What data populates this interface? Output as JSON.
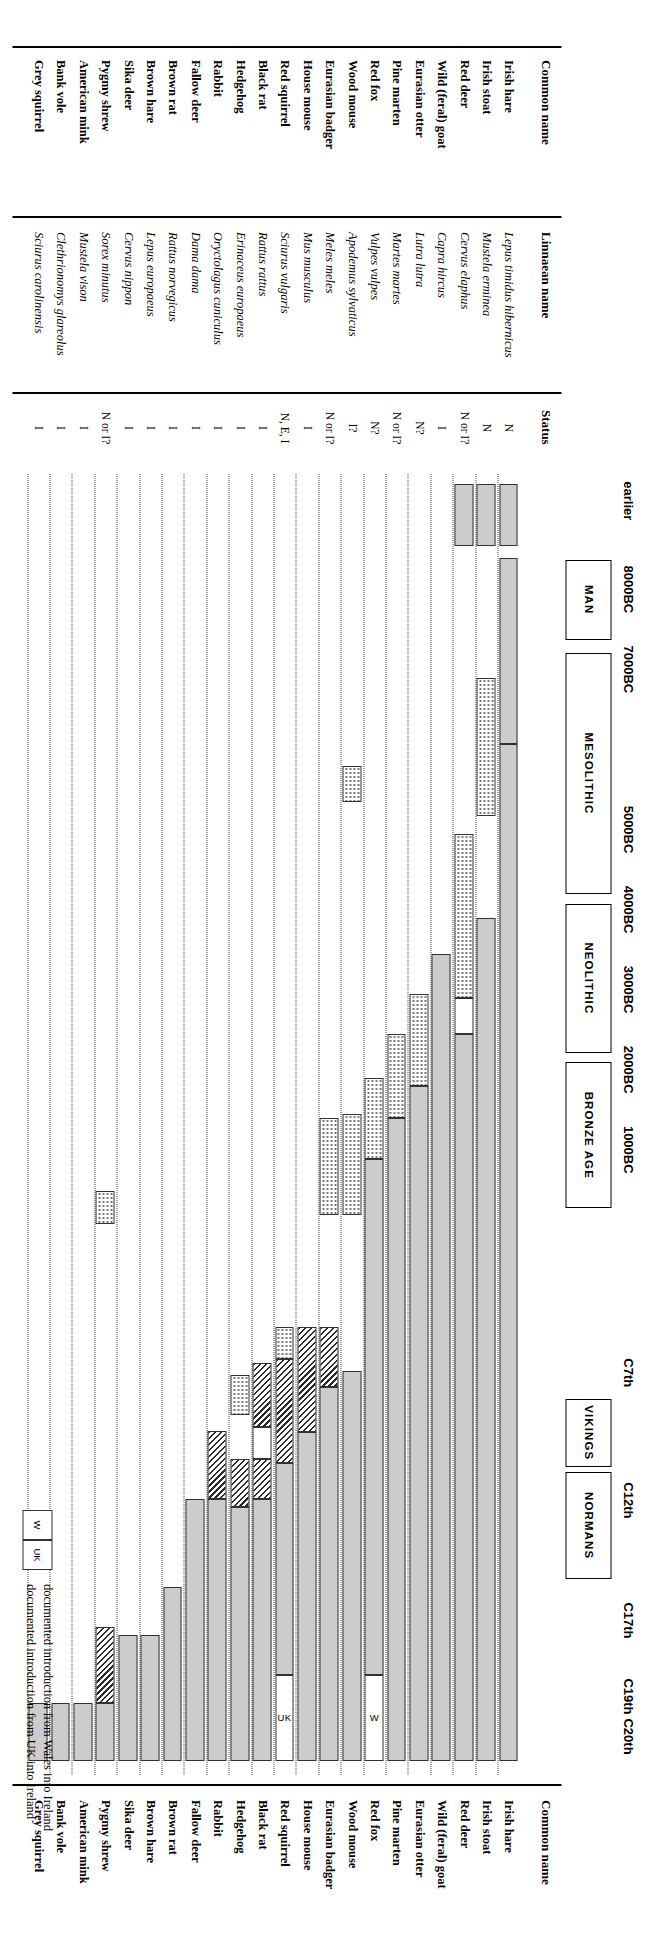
{
  "figure": {
    "headers": {
      "common_name_left": "Common name",
      "linnaean_name": "Linnaean name",
      "status": "Status",
      "common_name_right": "Common name"
    },
    "axis_ticks": [
      {
        "label": "earlier",
        "x": 0.5
      },
      {
        "label": "8000BC",
        "x": 1.5
      },
      {
        "label": "7000BC",
        "x": 2.5
      },
      {
        "label": "5000BC",
        "x": 4.5
      },
      {
        "label": "4000BC",
        "x": 5.5
      },
      {
        "label": "3000BC",
        "x": 6.5
      },
      {
        "label": "2000BC",
        "x": 7.5
      },
      {
        "label": "1000BC",
        "x": 8.5
      },
      {
        "label": "C7th",
        "x": 11.3
      },
      {
        "label": "C12th",
        "x": 12.9
      },
      {
        "label": "C17th",
        "x": 14.4
      },
      {
        "label": "C19th",
        "x": 15.35
      },
      {
        "label": "C20th",
        "x": 15.85
      }
    ],
    "eras": [
      {
        "label": "MAN",
        "start": 1.12,
        "end": 2.12
      },
      {
        "label": "MESOLITHIC",
        "start": 2.28,
        "end": 5.3
      },
      {
        "label": "NEOLITHIC",
        "start": 5.42,
        "end": 7.28
      },
      {
        "label": "BRONZE AGE",
        "start": 7.4,
        "end": 9.22
      },
      {
        "label": "VIKINGS",
        "start": 11.6,
        "end": 12.45
      },
      {
        "label": "NORMANS",
        "start": 12.52,
        "end": 13.85
      }
    ],
    "legend": {
      "swatches": [
        {
          "fill": "solid",
          "text": "remains found in secure contexts in Ireland"
        },
        {
          "fill": "dots",
          "text": "undated remains present in Ireland, probably intrusive"
        },
        {
          "fill": "hatch",
          "text": "documentary evidence"
        }
      ],
      "intro_swatches": [
        {
          "code": "W",
          "text": "documented introduction from Wales into Ireland"
        },
        {
          "code": "UK",
          "text": "documented introduction from UK into Ireland"
        }
      ]
    },
    "species": [
      {
        "common": "Irish hare",
        "latin": "Lepus timidus hibernicus",
        "status": "N",
        "segments": [
          {
            "from": 0.18,
            "to": 0.95,
            "fill": "solid"
          },
          {
            "from": 1.1,
            "to": 3.42,
            "fill": "solid"
          },
          {
            "from": 3.42,
            "to": 16.12,
            "fill": "solid"
          }
        ]
      },
      {
        "common": "Irish stoat",
        "latin": "Mustela erminea",
        "status": "N",
        "segments": [
          {
            "from": 0.18,
            "to": 0.95,
            "fill": "solid"
          },
          {
            "from": 2.6,
            "to": 4.32,
            "fill": "dots"
          },
          {
            "from": 5.6,
            "to": 16.12,
            "fill": "solid"
          }
        ]
      },
      {
        "common": "Red deer",
        "latin": "Cervus elaphus",
        "status": "N or I?",
        "segments": [
          {
            "from": 0.18,
            "to": 0.95,
            "fill": "solid"
          },
          {
            "from": 4.55,
            "to": 6.6,
            "fill": "dots"
          },
          {
            "from": 6.6,
            "to": 7.05,
            "fill": "white"
          },
          {
            "from": 7.05,
            "to": 16.12,
            "fill": "solid"
          }
        ]
      },
      {
        "common": "Wild (feral) goat",
        "latin": "Capra hircus",
        "status": "I",
        "segments": [
          {
            "from": 6.05,
            "to": 16.12,
            "fill": "solid"
          }
        ]
      },
      {
        "common": "Eurasian otter",
        "latin": "Lutra lutra",
        "status": "N?",
        "segments": [
          {
            "from": 6.55,
            "to": 7.7,
            "fill": "dots"
          },
          {
            "from": 7.7,
            "to": 16.12,
            "fill": "solid"
          }
        ]
      },
      {
        "common": "Pine marten",
        "latin": "Martes martes",
        "status": "N or I?",
        "segments": [
          {
            "from": 7.05,
            "to": 8.1,
            "fill": "dots"
          },
          {
            "from": 8.1,
            "to": 16.12,
            "fill": "solid"
          }
        ]
      },
      {
        "common": "Red fox",
        "latin": "Vulpes vulpes",
        "status": "N?",
        "segments": [
          {
            "from": 7.6,
            "to": 8.6,
            "fill": "dots"
          },
          {
            "from": 8.6,
            "to": 15.05,
            "fill": "solid"
          },
          {
            "from": 15.05,
            "to": 16.12,
            "fill": "white",
            "label": "W"
          }
        ]
      },
      {
        "common": "Wood mouse",
        "latin": "Apodemus sylvaticus",
        "status": "I?",
        "segments": [
          {
            "from": 3.7,
            "to": 4.15,
            "fill": "dots"
          },
          {
            "from": 8.05,
            "to": 9.3,
            "fill": "dots"
          },
          {
            "from": 11.25,
            "to": 16.12,
            "fill": "solid"
          }
        ]
      },
      {
        "common": "Eurasian badger",
        "latin": "Meles meles",
        "status": "N or I?",
        "segments": [
          {
            "from": 8.1,
            "to": 9.3,
            "fill": "dots"
          },
          {
            "from": 10.7,
            "to": 11.45,
            "fill": "hatch"
          },
          {
            "from": 11.45,
            "to": 16.12,
            "fill": "solid"
          }
        ]
      },
      {
        "common": "House mouse",
        "latin": "Mus musculus",
        "status": "I",
        "segments": [
          {
            "from": 10.7,
            "to": 12.02,
            "fill": "hatch"
          },
          {
            "from": 12.02,
            "to": 16.12,
            "fill": "solid"
          }
        ]
      },
      {
        "common": "Red squirrel",
        "latin": "Sciurus vulgaris",
        "status": "N, E, I",
        "segments": [
          {
            "from": 10.7,
            "to": 11.1,
            "fill": "dots"
          },
          {
            "from": 11.1,
            "to": 12.4,
            "fill": "hatch"
          },
          {
            "from": 12.4,
            "to": 15.05,
            "fill": "solid"
          },
          {
            "from": 15.05,
            "to": 16.12,
            "fill": "white",
            "label": "UK"
          }
        ]
      },
      {
        "common": "Black rat",
        "latin": "Rattus rattus",
        "status": "I",
        "segments": [
          {
            "from": 11.15,
            "to": 11.95,
            "fill": "hatch"
          },
          {
            "from": 11.95,
            "to": 12.35,
            "fill": "white"
          },
          {
            "from": 12.35,
            "to": 12.85,
            "fill": "hatch"
          },
          {
            "from": 12.85,
            "to": 16.12,
            "fill": "solid"
          }
        ]
      },
      {
        "common": "Hedgehog",
        "latin": "Erinaceus europaeus",
        "status": "I",
        "segments": [
          {
            "from": 11.3,
            "to": 11.8,
            "fill": "dots"
          },
          {
            "from": 12.35,
            "to": 12.95,
            "fill": "hatch"
          },
          {
            "from": 12.95,
            "to": 16.12,
            "fill": "solid"
          }
        ]
      },
      {
        "common": "Rabbit",
        "latin": "Oryctolagus cuniculus",
        "status": "I",
        "segments": [
          {
            "from": 12.0,
            "to": 12.85,
            "fill": "hatch"
          },
          {
            "from": 12.85,
            "to": 16.12,
            "fill": "solid"
          }
        ]
      },
      {
        "common": "Fallow deer",
        "latin": "Dama dama",
        "status": "I",
        "segments": [
          {
            "from": 12.85,
            "to": 16.12,
            "fill": "solid"
          }
        ]
      },
      {
        "common": "Brown rat",
        "latin": "Rattus norvegicus",
        "status": "I",
        "segments": [
          {
            "from": 13.95,
            "to": 16.12,
            "fill": "solid"
          }
        ]
      },
      {
        "common": "Brown hare",
        "latin": "Lepus europaeus",
        "status": "I",
        "segments": [
          {
            "from": 14.55,
            "to": 16.12,
            "fill": "solid"
          }
        ]
      },
      {
        "common": "Sika deer",
        "latin": "Cervus nippon",
        "status": "I",
        "segments": [
          {
            "from": 14.55,
            "to": 16.12,
            "fill": "solid"
          }
        ]
      },
      {
        "common": "Pygmy shrew",
        "latin": "Sorex minutus",
        "status": "N or I?",
        "segments": [
          {
            "from": 9.0,
            "to": 9.42,
            "fill": "dots"
          },
          {
            "from": 14.45,
            "to": 15.4,
            "fill": "hatch"
          },
          {
            "from": 15.4,
            "to": 16.12,
            "fill": "solid"
          }
        ]
      },
      {
        "common": "American mink",
        "latin": "Mustela vison",
        "status": "I",
        "segments": [
          {
            "from": 15.4,
            "to": 16.12,
            "fill": "solid"
          }
        ]
      },
      {
        "common": "Bank vole",
        "latin": "Clethrionomys glareolus",
        "status": "I",
        "segments": [
          {
            "from": 15.4,
            "to": 16.12,
            "fill": "solid"
          }
        ]
      },
      {
        "common": "Grey squirrel",
        "latin": "Sciurus carolinensis",
        "status": "I",
        "segments": [
          {
            "from": 15.4,
            "to": 16.12,
            "fill": "solid"
          }
        ]
      }
    ]
  }
}
